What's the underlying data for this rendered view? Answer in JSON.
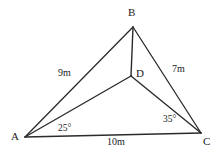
{
  "figure": {
    "background_color": "#ffffff",
    "stroke_color": "#2b2b2b",
    "text_color": "#1a1a1a",
    "vertices": [
      {
        "name": "A",
        "label": "A",
        "x": 25,
        "y": 137
      },
      {
        "name": "B",
        "label": "B",
        "x": 133,
        "y": 27
      },
      {
        "name": "C",
        "label": "C",
        "x": 201,
        "y": 133
      },
      {
        "name": "D",
        "label": "D",
        "x": 131,
        "y": 76
      }
    ],
    "vertex_labels": [
      {
        "name": "A",
        "text": "A",
        "left": 11,
        "top": 131
      },
      {
        "name": "B",
        "text": "B",
        "left": 128,
        "top": 7
      },
      {
        "name": "C",
        "text": "C",
        "left": 203,
        "top": 136
      },
      {
        "name": "D",
        "text": "D",
        "left": 136,
        "top": 68
      }
    ],
    "edges": [
      {
        "name": "side-ab",
        "from": "A",
        "to": "B",
        "length_label": "9m"
      },
      {
        "name": "side-bc",
        "from": "B",
        "to": "C",
        "length_label": "7m"
      },
      {
        "name": "side-ac",
        "from": "A",
        "to": "C",
        "length_label": "10m"
      },
      {
        "name": "segment-bd",
        "from": "B",
        "to": "D",
        "length_label": ""
      },
      {
        "name": "segment-ad",
        "from": "A",
        "to": "D",
        "length_label": ""
      },
      {
        "name": "segment-dc",
        "from": "D",
        "to": "C",
        "length_label": ""
      }
    ],
    "measure_labels": [
      {
        "name": "length-ab",
        "text": "9m",
        "left": 58,
        "top": 68
      },
      {
        "name": "length-bc",
        "text": "7m",
        "left": 172,
        "top": 64
      },
      {
        "name": "length-ac",
        "text": "10m",
        "left": 107,
        "top": 137
      }
    ],
    "angle_labels": [
      {
        "name": "angle-at-a",
        "text": "25°",
        "left": 58,
        "top": 124
      },
      {
        "name": "angle-at-c",
        "text": "35°",
        "left": 163,
        "top": 115
      }
    ]
  }
}
